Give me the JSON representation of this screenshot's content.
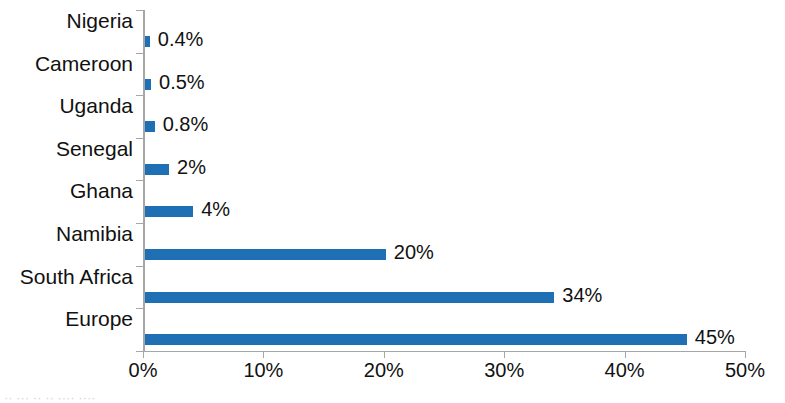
{
  "chart_data": {
    "type": "bar",
    "orientation": "horizontal",
    "title": "",
    "xlabel": "",
    "ylabel": "",
    "xlim": [
      0,
      50
    ],
    "xticks": [
      0,
      10,
      20,
      30,
      40,
      50
    ],
    "xtick_labels": [
      "0%",
      "10%",
      "20%",
      "30%",
      "40%",
      "50%"
    ],
    "grid": false,
    "legend": null,
    "bar_color": "#1f6fb4",
    "axis_color": "#a6a6a6",
    "categories": [
      "Nigeria",
      "Cameroon",
      "Uganda",
      "Senegal",
      "Ghana",
      "Namibia",
      "South Africa",
      "Europe"
    ],
    "values": [
      0.4,
      0.5,
      0.8,
      2,
      4,
      20,
      34,
      45
    ],
    "value_labels": [
      "0.4%",
      "0.5%",
      "0.8%",
      "2%",
      "4%",
      "20%",
      "34%",
      "45%"
    ]
  },
  "caption": {
    "fragment": "·· ··· ·· ·· ···· ····"
  }
}
